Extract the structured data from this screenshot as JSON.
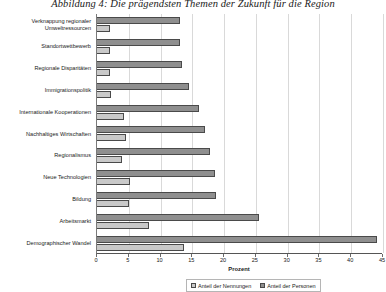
{
  "figure": {
    "title": "Abbildung 4:  Die prägendsten Themen der Zukunft für die Region"
  },
  "axis": {
    "xlabel": "Prozent",
    "ticks": [
      "0",
      "5",
      "10",
      "15",
      "20",
      "25",
      "30",
      "35",
      "40",
      "45"
    ]
  },
  "legend": {
    "items": [
      {
        "label": "Anteil der Nennungen",
        "color": "#c9c9c9"
      },
      {
        "label": "Anteil der Personen",
        "color": "#8f8f8f"
      }
    ]
  },
  "chart_data": {
    "type": "bar",
    "orientation": "horizontal",
    "title": "Abbildung 4:  Die prägendsten Themen der Zukunft für die Region",
    "xlabel": "Prozent",
    "ylabel": "",
    "xlim": [
      0,
      45
    ],
    "grid": true,
    "legend_position": "bottom",
    "categories": [
      "Verknappung regionaler Umweltressourcen",
      "Standortwettbewerb",
      "Regionale Disparitäten",
      "Immigrationspolitik",
      "Internationale Kooperationen",
      "Nachhaltiges Wirtschaften",
      "Regionalismus",
      "Neue Technologien",
      "Bildung",
      "Arbeitsmarkt",
      "Demographischer Wandel"
    ],
    "series": [
      {
        "name": "Anteil der Personen",
        "color": "#8f8f8f",
        "values": [
          13.0,
          13.0,
          13.3,
          14.5,
          16.0,
          17.0,
          17.8,
          18.5,
          18.8,
          25.5,
          44.0
        ]
      },
      {
        "name": "Anteil der Nennungen",
        "color": "#c9c9c9",
        "values": [
          2.0,
          2.0,
          2.0,
          2.2,
          4.2,
          4.5,
          4.0,
          5.2,
          5.0,
          8.2,
          13.7
        ]
      }
    ]
  }
}
